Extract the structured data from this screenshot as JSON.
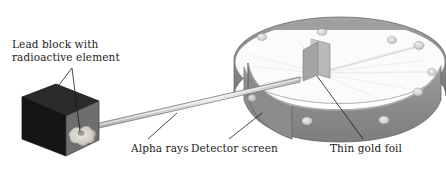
{
  "figure": {
    "background_color": "#ffffff",
    "width": 446,
    "height": 181
  },
  "labels": {
    "lead_block_line1": "Lead block with",
    "lead_block_line2": "radioactive element",
    "alpha_rays": "Alpha rays",
    "detector_screen": "Detector screen",
    "thin_gold_foil": "Thin gold foil"
  },
  "colors": {
    "text": "#1b1b1b",
    "leader_line": "#1b1b1b",
    "block_dark_face": "#171717",
    "block_top_face": "#2a2a2a",
    "block_front_face": "#6f6f6f",
    "radioactive_spot": "#d8d6cf",
    "tube_light": "#d9d9d9",
    "tube_outline": "#6b6b6b",
    "ring_band": "#8a8a8a",
    "ring_band_dark": "#747474",
    "ring_band_light": "#a8a8a8",
    "ring_interior": "#fbfbfb",
    "ring_inner_shadow": "#9c9c9c",
    "detector_spot": "#cfcfcf",
    "gold_foil": "#b4b4b4",
    "scatter_ray": "#f2f2f2"
  },
  "parts": {
    "lead_block": "lead-block-cube",
    "radioactive_element": "radioactive-element-spot",
    "collimator_tube": "alpha-beam-tube",
    "detector_ring": "circular-detector-screen",
    "gold_foil": "thin-gold-foil-sheet",
    "detector_spots": 8,
    "scatter_rays": 9
  }
}
